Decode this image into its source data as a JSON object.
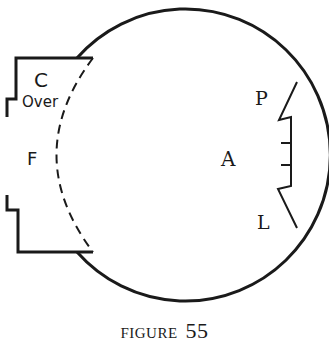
{
  "figure": {
    "caption_word": "FIGURE",
    "caption_number": "55"
  },
  "labels": {
    "c": "C",
    "over": "Over",
    "f": "F",
    "p": "P",
    "a": "A",
    "l": "L"
  },
  "colors": {
    "ink": "#1a1a1a",
    "background": "#ffffff"
  }
}
